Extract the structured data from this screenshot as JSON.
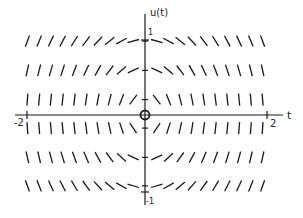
{
  "chart_data": {
    "type": "direction-field",
    "title": "",
    "equation_slope": "du/dt = -t/u",
    "xlabel": "t",
    "ylabel": "u(t)",
    "xlim": [
      -2,
      2
    ],
    "ylim": [
      -1,
      1
    ],
    "x_ticks": [
      {
        "value": -2,
        "label": "-2"
      },
      {
        "value": 2,
        "label": "2"
      }
    ],
    "y_ticks": [
      {
        "value": 1,
        "label": "1"
      },
      {
        "value": -1,
        "label": "-1"
      }
    ],
    "t_samples": [
      -2.0,
      -1.8,
      -1.6,
      -1.4,
      -1.2,
      -1.0,
      -0.8,
      -0.6,
      -0.4,
      -0.2,
      0.2,
      0.4,
      0.6,
      0.8,
      1.0,
      1.2,
      1.4,
      1.6,
      1.8,
      2.0
    ],
    "u_samples": [
      0.96,
      0.58,
      0.2,
      -0.17,
      -0.55,
      -0.92
    ],
    "origin_marker": "circle",
    "grid": false,
    "legend": null
  },
  "layout": {
    "origin_px": [
      145,
      115
    ],
    "px_per_t": 60,
    "px_per_u": 77,
    "segment_length": 12,
    "stroke_color": "#1a1a1a"
  }
}
